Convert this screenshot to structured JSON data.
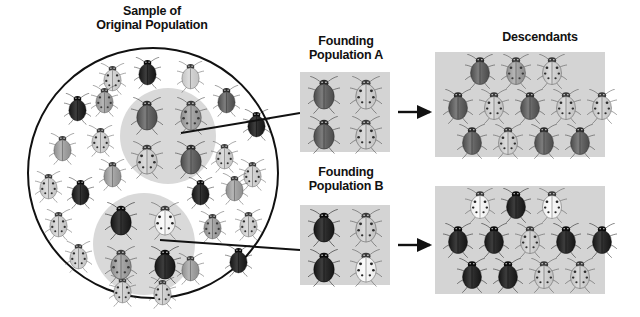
{
  "figure": {
    "type": "founder-effect-diagram",
    "organism": "ladybird beetle"
  },
  "labels": {
    "original": "Sample of\nOriginal Population",
    "founding_a": "Founding\nPopulation A",
    "founding_b": "Founding\nPopulation B",
    "descendants": "Descendants"
  },
  "colors": {
    "panel_gray": "#d4d4d4",
    "patch_gray": "#d9d9d9",
    "outline": "#111111",
    "background": "#ffffff"
  },
  "icons": {
    "arrow": "arrow-right-icon",
    "beetle": "beetle-icon",
    "connector": "connector-line-icon"
  },
  "original_population": {
    "shape": "circle",
    "count": 42,
    "beetles": [
      {
        "x": 70,
        "y": 14,
        "shade": "light",
        "spots": true
      },
      {
        "x": 105,
        "y": 8,
        "shade": "black",
        "spots": false
      },
      {
        "x": 148,
        "y": 12,
        "shade": "light",
        "spots": false
      },
      {
        "x": 35,
        "y": 44,
        "shade": "black",
        "spots": false
      },
      {
        "x": 62,
        "y": 36,
        "shade": "medium",
        "spots": true
      },
      {
        "x": 184,
        "y": 36,
        "shade": "dark",
        "spots": false
      },
      {
        "x": 214,
        "y": 60,
        "shade": "black",
        "spots": false
      },
      {
        "x": 20,
        "y": 84,
        "shade": "medium",
        "spots": false
      },
      {
        "x": 58,
        "y": 76,
        "shade": "light",
        "spots": true
      },
      {
        "x": 70,
        "y": 110,
        "shade": "medium",
        "spots": false
      },
      {
        "x": 182,
        "y": 92,
        "shade": "light",
        "spots": true
      },
      {
        "x": 210,
        "y": 110,
        "shade": "light",
        "spots": true
      },
      {
        "x": 6,
        "y": 122,
        "shade": "light",
        "spots": true
      },
      {
        "x": 38,
        "y": 128,
        "shade": "black",
        "spots": false
      },
      {
        "x": 158,
        "y": 128,
        "shade": "black",
        "spots": false
      },
      {
        "x": 192,
        "y": 124,
        "shade": "medium",
        "spots": false
      },
      {
        "x": 16,
        "y": 160,
        "shade": "light",
        "spots": true
      },
      {
        "x": 170,
        "y": 162,
        "shade": "medium",
        "spots": true
      },
      {
        "x": 206,
        "y": 160,
        "shade": "light",
        "spots": true
      },
      {
        "x": 36,
        "y": 192,
        "shade": "light",
        "spots": true
      },
      {
        "x": 196,
        "y": 196,
        "shade": "black",
        "spots": false
      },
      {
        "x": 148,
        "y": 204,
        "shade": "medium",
        "spots": false
      },
      {
        "x": 80,
        "y": 226,
        "shade": "light",
        "spots": true
      },
      {
        "x": 120,
        "y": 228,
        "shade": "light",
        "spots": true
      }
    ],
    "patch_a": {
      "label": "founding-sample-a",
      "beetles": [
        {
          "shade": "dark",
          "spots": false
        },
        {
          "shade": "medium",
          "spots": true
        },
        {
          "shade": "light",
          "spots": true
        },
        {
          "shade": "dark",
          "spots": false
        }
      ]
    },
    "patch_b": {
      "label": "founding-sample-b",
      "beetles": [
        {
          "shade": "black",
          "spots": false
        },
        {
          "shade": "white",
          "spots": true
        },
        {
          "shade": "medium",
          "spots": true
        },
        {
          "shade": "black",
          "spots": false
        }
      ]
    }
  },
  "founding_a": {
    "rows": 2,
    "cols": 2,
    "beetles": [
      {
        "shade": "dark",
        "spots": false
      },
      {
        "shade": "light",
        "spots": true
      },
      {
        "shade": "dark",
        "spots": false
      },
      {
        "shade": "light",
        "spots": true
      }
    ]
  },
  "founding_b": {
    "rows": 2,
    "cols": 2,
    "beetles": [
      {
        "shade": "black",
        "spots": false
      },
      {
        "shade": "light",
        "spots": true
      },
      {
        "shade": "black",
        "spots": false
      },
      {
        "shade": "white",
        "spots": true
      }
    ]
  },
  "descendants_a": {
    "rows": [
      [
        {
          "shade": "dark",
          "spots": false
        },
        {
          "shade": "medium",
          "spots": true
        },
        {
          "shade": "light",
          "spots": true
        }
      ],
      [
        {
          "shade": "dark",
          "spots": false
        },
        {
          "shade": "light",
          "spots": true
        },
        {
          "shade": "dark",
          "spots": false
        },
        {
          "shade": "light",
          "spots": true
        },
        {
          "shade": "light",
          "spots": true
        }
      ],
      [
        {
          "shade": "dark",
          "spots": false
        },
        {
          "shade": "light",
          "spots": true
        },
        {
          "shade": "dark",
          "spots": false
        },
        {
          "shade": "dark",
          "spots": false
        }
      ]
    ],
    "count": 12
  },
  "descendants_b": {
    "rows": [
      [
        {
          "shade": "white",
          "spots": true
        },
        {
          "shade": "black",
          "spots": false
        },
        {
          "shade": "white",
          "spots": true
        }
      ],
      [
        {
          "shade": "black",
          "spots": false
        },
        {
          "shade": "black",
          "spots": false
        },
        {
          "shade": "light",
          "spots": true
        },
        {
          "shade": "black",
          "spots": false
        },
        {
          "shade": "black",
          "spots": false
        }
      ],
      [
        {
          "shade": "black",
          "spots": false
        },
        {
          "shade": "black",
          "spots": false
        },
        {
          "shade": "light",
          "spots": true
        },
        {
          "shade": "light",
          "spots": true
        }
      ]
    ],
    "count": 12
  }
}
